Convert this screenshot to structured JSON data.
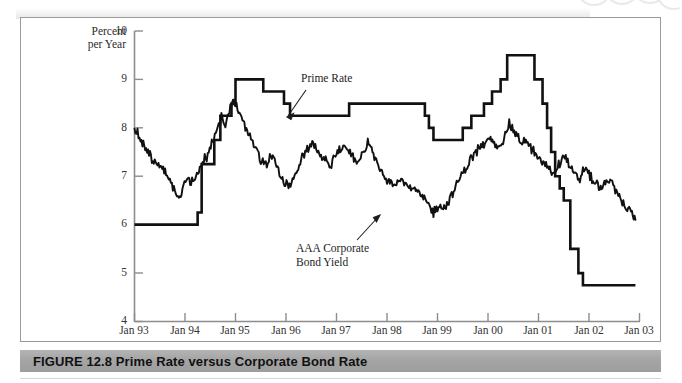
{
  "figure": {
    "caption_label": "FIGURE 12.8",
    "caption_title": "Prime Rate versus Corporate Bond Rate",
    "caption_full": "FIGURE 12.8  Prime Rate versus Corporate Bond Rate"
  },
  "annotations": {
    "prime_rate_label": "Prime Rate",
    "bond_yield_label": "AAA Corporate\nBond Yield"
  },
  "axis": {
    "y_title": "Percent\nper Year",
    "y_ticks": [
      "10",
      "9",
      "8",
      "7",
      "6",
      "5",
      "4"
    ],
    "x_ticks": [
      "Jan 93",
      "Jan 94",
      "Jan 95",
      "Jan 96",
      "Jan 97",
      "Jan 98",
      "Jan 99",
      "Jan 00",
      "Jan 01",
      "Jan 02",
      "Jan 03"
    ]
  },
  "colors": {
    "line": "#111111",
    "axis": "#8d8d8d",
    "caption_bar": "#a6a6a6",
    "frame": "#9a9a9a",
    "text": "#222222"
  },
  "chart_data": {
    "type": "line",
    "title": "Prime Rate versus Corporate Bond Rate",
    "xlabel": "",
    "ylabel": "Percent per Year",
    "xlim": [
      "Jan 93",
      "Jan 03"
    ],
    "ylim": [
      4,
      10
    ],
    "ytick_values": [
      4,
      5,
      6,
      7,
      8,
      9,
      10
    ],
    "xtick_values": [
      "Jan 93",
      "Jan 94",
      "Jan 95",
      "Jan 96",
      "Jan 97",
      "Jan 98",
      "Jan 99",
      "Jan 00",
      "Jan 01",
      "Jan 02",
      "Jan 03"
    ],
    "grid": false,
    "legend": "annotations-inline",
    "series": [
      {
        "name": "Prime Rate",
        "style": "step",
        "points": [
          [
            1993.0,
            6.0
          ],
          [
            1994.25,
            6.0
          ],
          [
            1994.25,
            6.25
          ],
          [
            1994.33,
            6.25
          ],
          [
            1994.33,
            7.25
          ],
          [
            1994.45,
            7.25
          ],
          [
            1994.45,
            7.25
          ],
          [
            1994.58,
            7.25
          ],
          [
            1994.58,
            7.75
          ],
          [
            1994.7,
            7.75
          ],
          [
            1994.7,
            8.25
          ],
          [
            1994.92,
            8.25
          ],
          [
            1994.92,
            8.5
          ],
          [
            1995.0,
            8.5
          ],
          [
            1995.0,
            9.0
          ],
          [
            1995.55,
            9.0
          ],
          [
            1995.55,
            8.75
          ],
          [
            1995.96,
            8.75
          ],
          [
            1995.96,
            8.5
          ],
          [
            1996.08,
            8.5
          ],
          [
            1996.08,
            8.25
          ],
          [
            1997.25,
            8.25
          ],
          [
            1997.25,
            8.5
          ],
          [
            1998.75,
            8.5
          ],
          [
            1998.75,
            8.25
          ],
          [
            1998.83,
            8.25
          ],
          [
            1998.83,
            8.0
          ],
          [
            1998.92,
            8.0
          ],
          [
            1998.92,
            7.75
          ],
          [
            1999.5,
            7.75
          ],
          [
            1999.5,
            8.0
          ],
          [
            1999.67,
            8.0
          ],
          [
            1999.67,
            8.25
          ],
          [
            1999.92,
            8.25
          ],
          [
            1999.92,
            8.5
          ],
          [
            2000.08,
            8.5
          ],
          [
            2000.08,
            8.75
          ],
          [
            2000.25,
            8.75
          ],
          [
            2000.25,
            9.0
          ],
          [
            2000.38,
            9.0
          ],
          [
            2000.38,
            9.5
          ],
          [
            2000.92,
            9.5
          ],
          [
            2000.92,
            9.0
          ],
          [
            2001.08,
            9.0
          ],
          [
            2001.08,
            8.5
          ],
          [
            2001.17,
            8.5
          ],
          [
            2001.17,
            8.0
          ],
          [
            2001.25,
            8.0
          ],
          [
            2001.25,
            7.5
          ],
          [
            2001.33,
            7.5
          ],
          [
            2001.33,
            7.0
          ],
          [
            2001.42,
            7.0
          ],
          [
            2001.42,
            6.75
          ],
          [
            2001.5,
            6.75
          ],
          [
            2001.5,
            6.5
          ],
          [
            2001.63,
            6.5
          ],
          [
            2001.63,
            5.5
          ],
          [
            2001.79,
            5.5
          ],
          [
            2001.79,
            5.0
          ],
          [
            2001.88,
            5.0
          ],
          [
            2001.88,
            4.75
          ],
          [
            2002.92,
            4.75
          ]
        ],
        "description": "Step function. Starts 6.00 and flat through early 1994, steps up through 1994 to a peak of 9.00 at Jan 1995, eases to 8.25 in 1996, 8.50 in 1997-98, down to 7.75 in 1999, rises to a 9.50 peak in mid-2000, then falls sharply through 2001 to 4.75 where it stays flat into 2003."
      },
      {
        "name": "AAA Corporate Bond Yield",
        "style": "line",
        "description": "Volatile monthly/weekly series. Starts near 8.0 in Jan 1993, declines to about 6.5 in late 1993, rises to a peak near 8.6 in late 1994, falls to roughly 6.8 in early 1996, oscillates 7.0-7.8 through 1996-97, declines to a low near 6.2 in late 1998 / early 1999, climbs to a peak about 8.1 in mid-2000, then trends down with large swings to about 6.1 by late 2002.",
        "key_points": [
          [
            1993.0,
            8.0
          ],
          [
            1993.1,
            7.8
          ],
          [
            1993.25,
            7.5
          ],
          [
            1993.4,
            7.3
          ],
          [
            1993.55,
            7.2
          ],
          [
            1993.7,
            6.95
          ],
          [
            1993.8,
            6.7
          ],
          [
            1993.88,
            6.5
          ],
          [
            1993.95,
            6.75
          ],
          [
            1994.05,
            6.95
          ],
          [
            1994.12,
            6.85
          ],
          [
            1994.2,
            7.0
          ],
          [
            1994.33,
            7.25
          ],
          [
            1994.45,
            7.45
          ],
          [
            1994.55,
            7.7
          ],
          [
            1994.65,
            8.0
          ],
          [
            1994.72,
            8.2
          ],
          [
            1994.8,
            8.05
          ],
          [
            1994.88,
            8.35
          ],
          [
            1994.95,
            8.6
          ],
          [
            1995.02,
            8.45
          ],
          [
            1995.12,
            8.2
          ],
          [
            1995.25,
            7.9
          ],
          [
            1995.38,
            7.6
          ],
          [
            1995.5,
            7.35
          ],
          [
            1995.62,
            7.25
          ],
          [
            1995.72,
            7.45
          ],
          [
            1995.85,
            7.1
          ],
          [
            1995.95,
            6.9
          ],
          [
            1996.05,
            6.8
          ],
          [
            1996.15,
            7.0
          ],
          [
            1996.3,
            7.35
          ],
          [
            1996.42,
            7.55
          ],
          [
            1996.52,
            7.7
          ],
          [
            1996.62,
            7.5
          ],
          [
            1996.75,
            7.35
          ],
          [
            1996.88,
            7.2
          ],
          [
            1997.0,
            7.45
          ],
          [
            1997.15,
            7.65
          ],
          [
            1997.25,
            7.5
          ],
          [
            1997.4,
            7.3
          ],
          [
            1997.52,
            7.45
          ],
          [
            1997.62,
            7.7
          ],
          [
            1997.75,
            7.4
          ],
          [
            1997.88,
            7.1
          ],
          [
            1998.0,
            6.95
          ],
          [
            1998.15,
            6.85
          ],
          [
            1998.28,
            6.95
          ],
          [
            1998.42,
            6.8
          ],
          [
            1998.55,
            6.7
          ],
          [
            1998.68,
            6.6
          ],
          [
            1998.8,
            6.45
          ],
          [
            1998.92,
            6.25
          ],
          [
            1999.02,
            6.4
          ],
          [
            1999.15,
            6.35
          ],
          [
            1999.28,
            6.6
          ],
          [
            1999.42,
            6.9
          ],
          [
            1999.55,
            7.15
          ],
          [
            1999.68,
            7.4
          ],
          [
            1999.8,
            7.55
          ],
          [
            1999.92,
            7.65
          ],
          [
            2000.05,
            7.8
          ],
          [
            2000.18,
            7.6
          ],
          [
            2000.3,
            7.75
          ],
          [
            2000.42,
            8.1
          ],
          [
            2000.52,
            7.9
          ],
          [
            2000.62,
            7.75
          ],
          [
            2000.75,
            7.7
          ],
          [
            2000.88,
            7.55
          ],
          [
            2001.0,
            7.35
          ],
          [
            2001.15,
            7.25
          ],
          [
            2001.28,
            7.05
          ],
          [
            2001.4,
            7.25
          ],
          [
            2001.52,
            7.45
          ],
          [
            2001.62,
            7.2
          ],
          [
            2001.72,
            7.0
          ],
          [
            2001.82,
            6.95
          ],
          [
            2001.92,
            7.2
          ],
          [
            2002.02,
            7.0
          ],
          [
            2002.12,
            6.85
          ],
          [
            2002.25,
            6.75
          ],
          [
            2002.38,
            6.95
          ],
          [
            2002.5,
            6.75
          ],
          [
            2002.62,
            6.55
          ],
          [
            2002.72,
            6.35
          ],
          [
            2002.85,
            6.25
          ],
          [
            2002.92,
            6.1
          ]
        ]
      }
    ]
  }
}
